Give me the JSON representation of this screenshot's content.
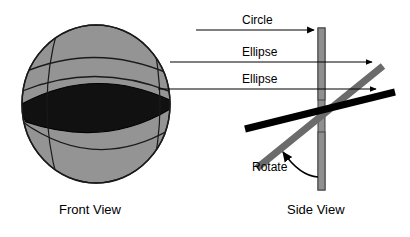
{
  "figure": {
    "background_color": "#ffffff"
  },
  "views": {
    "front": {
      "caption": "Front View",
      "sphere": {
        "fill_color": "#949494",
        "outline_color": "#1a1a1a",
        "center_x": 96,
        "center_y": 104,
        "radius_x": 74,
        "radius_y": 79
      },
      "sections": [
        {
          "name": "circle",
          "label": "Circle",
          "style": "arc-outline",
          "fill_color": "#949494",
          "stroke_color": "#1a1a1a"
        },
        {
          "name": "ellipse-upper",
          "label": "Ellipse",
          "style": "arc-outline",
          "fill_color": "#949494",
          "stroke_color": "#1a1a1a"
        },
        {
          "name": "ellipse-equator",
          "label": "Ellipse",
          "style": "filled",
          "fill_color": "#111111",
          "stroke_color": "#000000"
        }
      ]
    },
    "side": {
      "caption": "Side View",
      "axis_bar": {
        "name": "vertical-plate",
        "fill_color": "#8f8f8f",
        "outline_color": "#4a4a4a",
        "x": 318,
        "top": 28,
        "bottom": 190,
        "width": 7
      },
      "planes": [
        {
          "name": "gray-plane",
          "color": "#6b6b6b",
          "thickness": 7,
          "angle_label": "tilted"
        },
        {
          "name": "black-plane",
          "color": "#000000",
          "thickness": 7,
          "angle_label": "tilted-shallow"
        }
      ]
    }
  },
  "annotations": {
    "leaders": [
      {
        "name": "leader-circle",
        "label": "Circle",
        "from_x": 196,
        "to_x": 316,
        "y": 30,
        "arrow": "right",
        "color": "#000000"
      },
      {
        "name": "leader-ellipse-upper",
        "label": "Ellipse",
        "from_x": 170,
        "to_x": 374,
        "y": 62,
        "arrow": "right",
        "color": "#000000"
      },
      {
        "name": "leader-ellipse-equator",
        "label": "Ellipse",
        "from_x": 158,
        "to_x": 378,
        "y": 89,
        "arrow": "right",
        "color": "#000000"
      }
    ],
    "rotate": {
      "name": "rotate-arrow",
      "label": "Rotate",
      "arrow": "curved-left",
      "color": "#000000"
    }
  },
  "colors": {
    "sphere_gray": "#949494",
    "dark_fill": "#111111",
    "plane_gray": "#6b6b6b",
    "plane_black": "#000000",
    "bar_gray": "#8f8f8f",
    "line_black": "#000000",
    "page_white": "#ffffff"
  }
}
